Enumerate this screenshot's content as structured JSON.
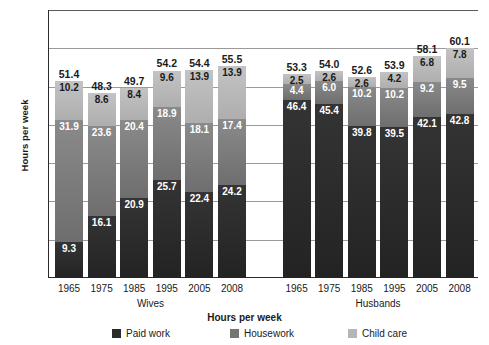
{
  "chart_data": {
    "type": "bar",
    "subtype": "stacked-bar-grouped",
    "title": "",
    "xlabel": "Hours per week",
    "ylabel": "Hours per week",
    "ylim": [
      0,
      70
    ],
    "yticks": [
      0,
      10,
      20,
      30,
      40,
      50,
      60,
      70
    ],
    "grid": true,
    "legend_position": "bottom",
    "categories": [
      "1965",
      "1975",
      "1985",
      "1995",
      "2005",
      "2008"
    ],
    "groups": [
      {
        "name": "Wives",
        "categories": [
          "1965",
          "1975",
          "1985",
          "1995",
          "2005",
          "2008"
        ],
        "totals": [
          51.4,
          48.3,
          49.7,
          54.2,
          54.4,
          55.5
        ],
        "series": [
          {
            "name": "Paid work",
            "values": [
              9.3,
              16.1,
              20.9,
              25.7,
              22.4,
              24.2
            ]
          },
          {
            "name": "Housework",
            "values": [
              31.9,
              23.6,
              20.4,
              18.9,
              18.1,
              17.4
            ]
          },
          {
            "name": "Child care",
            "values": [
              10.2,
              8.6,
              8.4,
              9.6,
              13.9,
              13.9
            ]
          }
        ]
      },
      {
        "name": "Husbands",
        "categories": [
          "1965",
          "1975",
          "1985",
          "1995",
          "2005",
          "2008"
        ],
        "totals": [
          53.3,
          54.0,
          52.6,
          53.9,
          58.1,
          60.1
        ],
        "series": [
          {
            "name": "Paid work",
            "values": [
              46.4,
              45.4,
              39.8,
              39.5,
              42.1,
              42.8
            ]
          },
          {
            "name": "Housework",
            "values": [
              4.4,
              6.0,
              10.2,
              10.2,
              9.2,
              9.5
            ]
          },
          {
            "name": "Child care",
            "values": [
              2.5,
              2.6,
              2.6,
              4.2,
              6.8,
              7.8
            ]
          }
        ]
      }
    ],
    "legend": [
      {
        "label": "Paid work",
        "color": "#2b2b2b"
      },
      {
        "label": "Housework",
        "color": "#757575"
      },
      {
        "label": "Child care",
        "color": "#b5b5b5"
      }
    ]
  },
  "axis": {
    "y_title": "Hours per week",
    "x_title": "Hours per week"
  }
}
